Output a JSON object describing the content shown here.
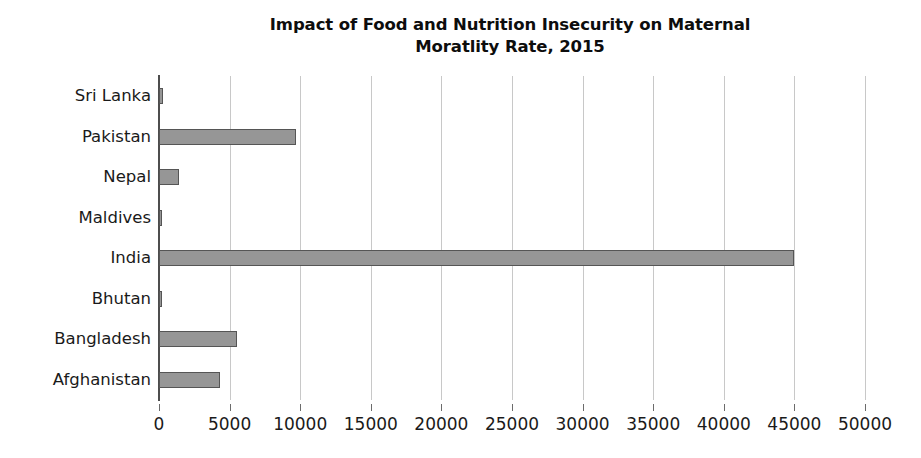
{
  "chart_data": {
    "type": "bar",
    "orientation": "horizontal",
    "title": "Impact of Food and Nutrition Insecurity on Maternal\nMoratlity Rate, 2015",
    "title_line1": "Impact of Food and Nutrition Insecurity on Maternal",
    "title_line2": "Moratlity Rate, 2015",
    "xlabel": "",
    "ylabel": "",
    "categories": [
      "Sri Lanka",
      "Pakistan",
      "Nepal",
      "Maldives",
      "India",
      "Bhutan",
      "Bangladesh",
      "Afghanistan"
    ],
    "values": [
      250,
      9700,
      1400,
      10,
      45000,
      80,
      5500,
      4300
    ],
    "xlim": [
      0,
      50000
    ],
    "xticks": [
      0,
      5000,
      10000,
      15000,
      20000,
      25000,
      30000,
      35000,
      40000,
      45000,
      50000
    ],
    "xticklabels": [
      "0",
      "5000",
      "10000",
      "15000",
      "20000",
      "25000",
      "30000",
      "35000",
      "40000",
      "45000",
      "50000"
    ],
    "grid": "vertical",
    "legend": null,
    "series": [
      {
        "name": "Maternal Mortality Rate",
        "values": [
          250,
          9700,
          1400,
          10,
          45000,
          80,
          5500,
          4300
        ]
      }
    ],
    "colors": {
      "bar_fill": "#969696",
      "bar_border": "#555555",
      "gridline": "#c8c8c8",
      "axis": "#4d4d4d",
      "text": "#1a1a1a",
      "background": "#ffffff"
    }
  }
}
